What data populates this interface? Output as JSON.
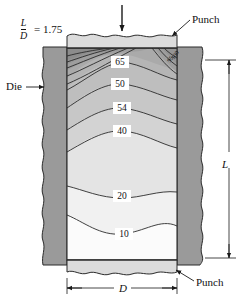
{
  "figure": {
    "title_ratio": {
      "numerator": "L",
      "denominator": "D",
      "equals": "= 1.75"
    },
    "labels": {
      "punch_top": "Punch",
      "punch_bottom": "Punch",
      "die": "Die",
      "dim_length": "L",
      "dim_diameter": "D"
    },
    "icons": {
      "load_arrow": "down-arrow-icon",
      "die_leader": "leader-arrow-icon",
      "punch_top_leader": "leader-arrow-icon",
      "punch_bottom_leader": "leader-arrow-icon"
    },
    "colors": {
      "die_fill": "#9a9a9a",
      "punch_fill": "#dcdcdc",
      "outline": "#222222",
      "background": "#ffffff"
    }
  },
  "chart_data": {
    "type": "contour",
    "xlabel": "D",
    "ylabel": "L",
    "grid": false,
    "legend": "none",
    "contour_levels": [
      10,
      20,
      40,
      54,
      50,
      65,
      95,
      100
    ],
    "labeled_contours": [
      {
        "value": "65",
        "x": 120,
        "y": 62,
        "rotation": 0
      },
      {
        "value": "50",
        "x": 120,
        "y": 84,
        "rotation": 0
      },
      {
        "value": "54",
        "x": 122,
        "y": 108,
        "rotation": 0
      },
      {
        "value": "40",
        "x": 122,
        "y": 131,
        "rotation": 0
      },
      {
        "value": "20",
        "x": 122,
        "y": 196,
        "rotation": 0
      },
      {
        "value": "10",
        "x": 124,
        "y": 234,
        "rotation": 0
      },
      {
        "value": "100",
        "x": 170,
        "y": 57,
        "rotation": -55
      },
      {
        "value": "95",
        "x": 166,
        "y": 60,
        "rotation": -55
      }
    ],
    "zones": [
      {
        "name": "dead-metal-upper-left",
        "shade": "#8f8f8f",
        "note": "darkest, highest deformation"
      },
      {
        "name": "dead-metal-upper-right",
        "shade": "#8f8f8f",
        "note": "darkest, highest deformation"
      },
      {
        "name": "band-65",
        "shade": "#b4b4b4"
      },
      {
        "name": "band-50",
        "shade": "#bdbdbd"
      },
      {
        "name": "band-54",
        "shade": "#c6c6c6"
      },
      {
        "name": "band-40",
        "shade": "#d2d2d2"
      },
      {
        "name": "band-20",
        "shade": "#e2e2e2"
      },
      {
        "name": "band-10",
        "shade": "#f0f0f0"
      },
      {
        "name": "base",
        "shade": "#fafafa",
        "note": "lightest, least deformation"
      }
    ]
  }
}
